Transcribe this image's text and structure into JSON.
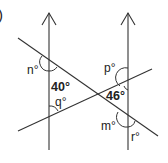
{
  "question_marker": ")",
  "labels": {
    "n": "n°",
    "p": "p°",
    "q": "q°",
    "m": "m°",
    "r": "r°",
    "angle_40": "40°",
    "angle_46": "46°"
  },
  "colors": {
    "line": "#333333",
    "text": "#222222",
    "background": "#ffffff"
  }
}
